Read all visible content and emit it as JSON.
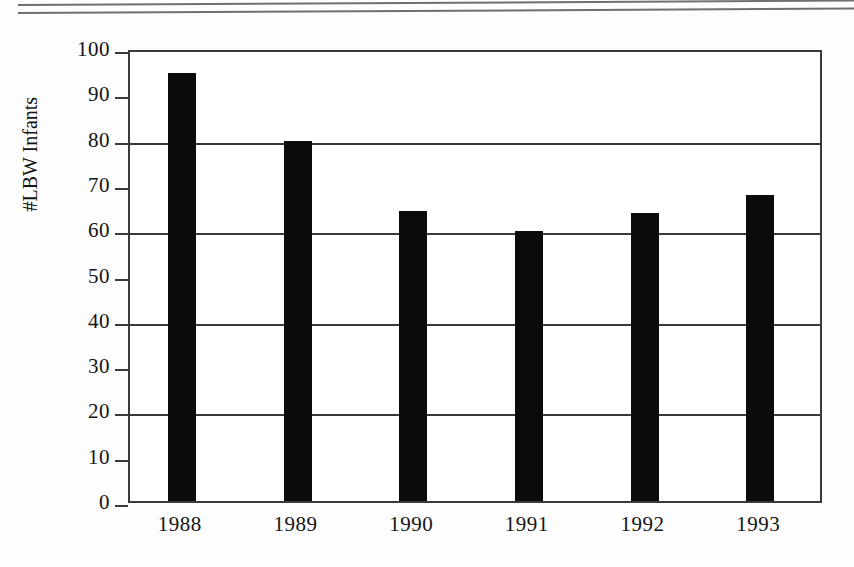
{
  "page": {
    "background_color": "#fdfdfd",
    "rule_color": "#6f6f6f",
    "top_rules": 2
  },
  "chart_data": {
    "type": "bar",
    "title": "",
    "xlabel": "",
    "ylabel": "#LBW Infants",
    "categories": [
      "1988",
      "1989",
      "1990",
      "1991",
      "1992",
      "1993"
    ],
    "values": [
      94.5,
      79.5,
      64.0,
      59.5,
      63.5,
      67.5
    ],
    "series": [
      {
        "name": "#LBW Infants",
        "values": [
          94.5,
          79.5,
          64.0,
          59.5,
          63.5,
          67.5
        ]
      }
    ],
    "ylim": [
      0,
      100
    ],
    "ytick_values": [
      0,
      10,
      20,
      30,
      40,
      50,
      60,
      70,
      80,
      90,
      100
    ],
    "ytick_labels": [
      "0",
      "10",
      "20",
      "30",
      "40",
      "50",
      "60",
      "70",
      "80",
      "90",
      "100"
    ],
    "gridline_values": [
      20,
      40,
      60,
      80
    ],
    "grid": true,
    "legend": false,
    "legend_position": "none",
    "bar_color": "#0b0b0b",
    "axis_color": "#3a3a3a"
  }
}
